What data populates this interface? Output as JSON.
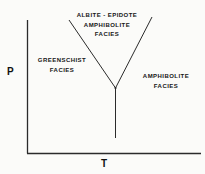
{
  "figure": {
    "type": "pressure-temperature-facies-diagram",
    "axes": {
      "y_label": "P",
      "x_label": "T"
    },
    "regions": [
      {
        "id": "albite-epidote-amphibolite",
        "lines": [
          "ALBITE - EPIDOTE",
          "AMPHIBOLITE",
          "FACIES"
        ]
      },
      {
        "id": "greenschist",
        "lines": [
          "GREENSCHIST",
          "FACIES"
        ]
      },
      {
        "id": "amphibolite",
        "lines": [
          "AMPHIBOLITE",
          "FACIES"
        ]
      }
    ],
    "colors": {
      "ink": "#2b2b2b",
      "text": "#161616",
      "background": "#fbfbf9"
    }
  }
}
